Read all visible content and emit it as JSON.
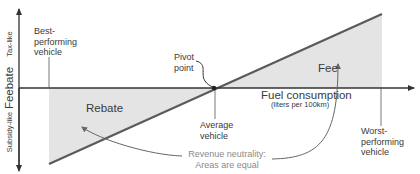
{
  "diagram": {
    "title": "Feebate",
    "y_axis": {
      "label": "Feebate",
      "top_label": "Tax-like",
      "bottom_label": "Subsidy-like"
    },
    "x_axis": {
      "label": "Fuel consumption",
      "unit_label": "(liters per 100km)"
    },
    "regions": {
      "fee": "Fee",
      "rebate": "Rebate"
    },
    "annotations": {
      "best_line1": "Best-",
      "best_line2": "performing",
      "best_line3": "vehicle",
      "pivot_line1": "Pivot",
      "pivot_line2": "point",
      "average_line1": "Average",
      "average_line2": "vehicle",
      "worst_line1": "Worst-",
      "worst_line2": "performing",
      "worst_line3": "vehicle",
      "neutrality_line1": "Revenue neutrality:",
      "neutrality_line2": "Areas are equal"
    },
    "colors": {
      "axis": "#333333",
      "line": "#555555",
      "shade": "#e4e4e4",
      "text": "#3a3a3a",
      "neutral_text": "#8a8a8a"
    }
  }
}
